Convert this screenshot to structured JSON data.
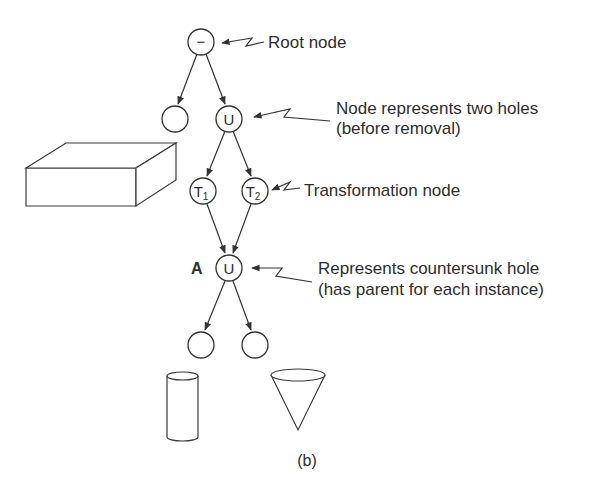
{
  "diagram": {
    "type": "CSG tree",
    "caption": "(b)",
    "nodes": [
      {
        "id": "root",
        "symbol": "−",
        "kind": "operator-difference"
      },
      {
        "id": "block-leaf",
        "symbol": "",
        "kind": "leaf"
      },
      {
        "id": "union-top",
        "symbol": "U",
        "kind": "operator-union"
      },
      {
        "id": "t1",
        "symbol": "T",
        "subscript": "1",
        "kind": "transformation"
      },
      {
        "id": "t2",
        "symbol": "T",
        "subscript": "2",
        "kind": "transformation"
      },
      {
        "id": "union-a",
        "symbol": "U",
        "kind": "operator-union",
        "tag": "A"
      },
      {
        "id": "cylinder-leaf",
        "symbol": "",
        "kind": "leaf"
      },
      {
        "id": "cone-leaf",
        "symbol": "",
        "kind": "leaf"
      }
    ],
    "edges": [
      [
        "root",
        "block-leaf"
      ],
      [
        "root",
        "union-top"
      ],
      [
        "union-top",
        "t1"
      ],
      [
        "union-top",
        "t2"
      ],
      [
        "t1",
        "union-a"
      ],
      [
        "t2",
        "union-a"
      ],
      [
        "union-a",
        "cylinder-leaf"
      ],
      [
        "union-a",
        "cone-leaf"
      ]
    ],
    "annotations": {
      "root": [
        "Root node"
      ],
      "union_top": [
        "Node represents two holes",
        "(before removal)"
      ],
      "transformation": [
        "Transformation node"
      ],
      "union_a": [
        "Represents countersunk hole",
        "(has parent for each instance)"
      ]
    },
    "node_tag_a": "A",
    "primitives": [
      "rectangular block",
      "cylinder",
      "cone"
    ]
  }
}
